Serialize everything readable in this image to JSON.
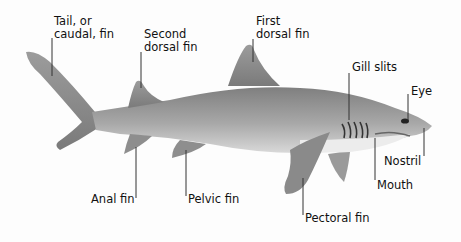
{
  "diagram": {
    "labels": [
      {
        "id": "tail",
        "text": "Tail, or\ncaudal, fin",
        "x": 54,
        "y": 15
      },
      {
        "id": "second-dorsal",
        "text": "Second\ndorsal fin",
        "x": 144,
        "y": 28
      },
      {
        "id": "first-dorsal",
        "text": "First\ndorsal fin",
        "x": 256,
        "y": 15
      },
      {
        "id": "gill-slits",
        "text": "Gill slits",
        "x": 352,
        "y": 61
      },
      {
        "id": "eye",
        "text": "Eye",
        "x": 411,
        "y": 85
      },
      {
        "id": "nostril",
        "text": "Nostril",
        "x": 384,
        "y": 154
      },
      {
        "id": "mouth",
        "text": "Mouth",
        "x": 377,
        "y": 178
      },
      {
        "id": "anal-fin",
        "text": "Anal fin",
        "x": 91,
        "y": 193
      },
      {
        "id": "pelvic-fin",
        "text": "Pelvic fin",
        "x": 188,
        "y": 193
      },
      {
        "id": "pectoral-fin",
        "text": "Pectoral fin",
        "x": 304,
        "y": 211
      }
    ],
    "colors": {
      "body": "#9a9a9a",
      "belly": "#e6e6e6",
      "line": "#333333"
    }
  }
}
